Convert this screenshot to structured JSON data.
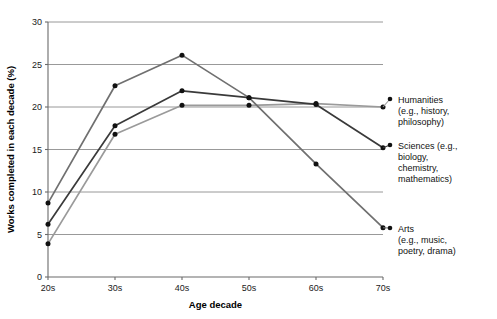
{
  "chart_data": {
    "type": "line",
    "title": "",
    "xlabel": "Age decade",
    "ylabel": "Works completed in each decade (%)",
    "categories": [
      "20s",
      "30s",
      "40s",
      "50s",
      "60s",
      "70s"
    ],
    "x_tick_labels": [
      "20s",
      "30s",
      "40s",
      "50s",
      "60s",
      "70s"
    ],
    "y_tick_labels": [
      "0",
      "5",
      "10",
      "15",
      "20",
      "25",
      "30"
    ],
    "y_ticks": [
      0,
      5,
      10,
      15,
      20,
      25,
      30
    ],
    "ylim": [
      0,
      30
    ],
    "grid": "horizontal",
    "legend_position": "right-attached-to-line-ends",
    "marker": "filled-circle",
    "series": [
      {
        "name": "Humanities",
        "legend_label": "Humanities",
        "legend_detail": "(e.g., history, philosophy)",
        "legend_lines": [
          "Humanities",
          "(e.g., history,",
          "philosophy)"
        ],
        "color": "#9a9a9a",
        "values": [
          3.9,
          16.8,
          20.2,
          20.2,
          20.4,
          20.0
        ]
      },
      {
        "name": "Sciences",
        "legend_label": "Sciences",
        "legend_detail": "(e.g., biology, chemistry, mathematics)",
        "legend_lines": [
          "Sciences (e.g.,",
          "biology,",
          "chemistry,",
          "mathematics)"
        ],
        "color": "#3a3a3a",
        "values": [
          6.2,
          17.8,
          21.9,
          21.1,
          20.3,
          15.2
        ]
      },
      {
        "name": "Arts",
        "legend_label": "Arts",
        "legend_detail": "(e.g., music, poetry, drama)",
        "legend_lines": [
          "Arts",
          "(e.g., music,",
          "poetry, drama)"
        ],
        "color": "#707070",
        "values": [
          8.7,
          22.5,
          26.1,
          21.1,
          13.3,
          5.8
        ]
      }
    ]
  },
  "plot": {
    "left": 48,
    "right": 383,
    "top": 22,
    "bottom": 277,
    "legend_x": 398,
    "legend_anchor_x": 390
  }
}
